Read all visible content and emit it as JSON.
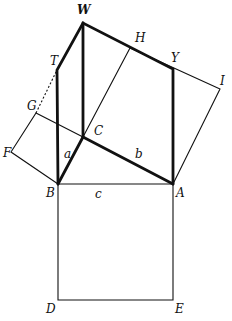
{
  "diagram": {
    "title": "",
    "points": {
      "W": {
        "label": "W",
        "x": 83,
        "y": 23,
        "lx": 77,
        "ly": 14
      },
      "T": {
        "label": "T",
        "x": 57,
        "y": 70,
        "lx": 50,
        "ly": 65
      },
      "G": {
        "label": "G",
        "x": 36,
        "y": 113,
        "lx": 27,
        "ly": 110
      },
      "F": {
        "label": "F",
        "x": 11,
        "y": 152,
        "lx": 3,
        "ly": 157
      },
      "C": {
        "label": "C",
        "x": 83,
        "y": 137,
        "lx": 94,
        "ly": 135
      },
      "B": {
        "label": "B",
        "x": 58,
        "y": 184,
        "lx": 46,
        "ly": 197
      },
      "A": {
        "label": "A",
        "x": 173,
        "y": 184,
        "lx": 176,
        "ly": 197
      },
      "H": {
        "label": "H",
        "x": 130,
        "y": 48,
        "lx": 135,
        "ly": 42
      },
      "Y": {
        "label": "Y",
        "x": 173,
        "y": 69,
        "lx": 171,
        "ly": 62
      },
      "I": {
        "label": "I",
        "x": 220,
        "y": 89,
        "lx": 220,
        "ly": 85
      },
      "D": {
        "label": "D",
        "x": 58,
        "y": 300,
        "lx": 46,
        "ly": 313
      },
      "E": {
        "label": "E",
        "x": 173,
        "y": 300,
        "lx": 175,
        "ly": 313
      }
    },
    "side_labels": {
      "a": {
        "label": "a",
        "x": 64,
        "y": 158
      },
      "b": {
        "label": "b",
        "x": 135,
        "y": 158
      },
      "c": {
        "label": "c",
        "x": 95,
        "y": 198
      }
    }
  }
}
